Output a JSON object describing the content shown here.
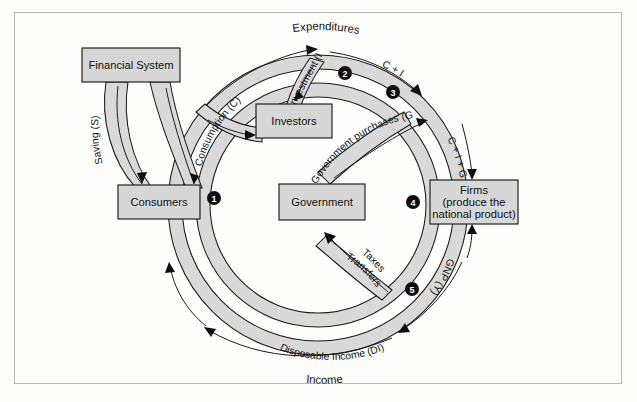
{
  "figure": {
    "type": "circular-flow-diagram",
    "title_top": "Expenditures",
    "title_bottom": "Income"
  },
  "boxes": [
    {
      "id": "financial-system",
      "label": "Financial System"
    },
    {
      "id": "investors",
      "label": "Investors"
    },
    {
      "id": "consumers",
      "label": "Consumers"
    },
    {
      "id": "government",
      "label": "Government"
    },
    {
      "id": "firms",
      "label_line1": "Firms",
      "label_line2": "(produce the",
      "label_line3": "national product)"
    }
  ],
  "flow_labels": {
    "saving": "Saving (S)",
    "consumption": "Consumption (C)",
    "investment": "Investment (I)",
    "c_plus_i": "C + I",
    "government_purchases": "Government purchases (G)",
    "c_plus_i_plus_g": "C + I + G",
    "gnp": "GNP (Y)",
    "taxes": "Taxes",
    "transfers": "Transfers",
    "disposable_income": "Disposable Income (DI)"
  },
  "markers": [
    {
      "id": "marker-1",
      "label": "1"
    },
    {
      "id": "marker-2",
      "label": "2"
    },
    {
      "id": "marker-3",
      "label": "3"
    },
    {
      "id": "marker-4",
      "label": "4"
    },
    {
      "id": "marker-5",
      "label": "5"
    }
  ],
  "colors": {
    "band_fill": "#d9d9d9",
    "box_fill": "#d7d7d7",
    "outline": "#1a1a1a",
    "marker": "#0d0d0d",
    "page": "#fdfdfc",
    "frame": "#b9b9b9"
  }
}
